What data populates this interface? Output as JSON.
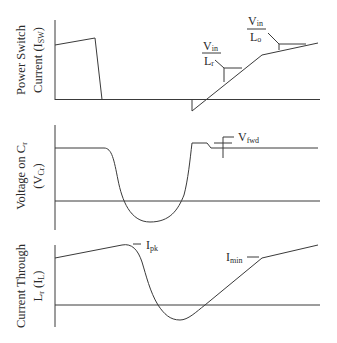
{
  "diagram": {
    "panels": [
      {
        "id": "power-switch-current",
        "ylabel_line1": "Power Switch",
        "ylabel_line2_main": "Current (I",
        "ylabel_line2_sub": "SW",
        "ylabel_line2_end": ")",
        "annotations": [
          {
            "num_main": "V",
            "num_sub": "in",
            "den_main": "L",
            "den_sub": "r"
          },
          {
            "num_main": "V",
            "num_sub": "in",
            "den_main": "L",
            "den_sub": "o"
          }
        ]
      },
      {
        "id": "voltage-on-cr",
        "ylabel_line1_main": "Voltage on C",
        "ylabel_line1_sub": "r",
        "ylabel_line2_main": "(V",
        "ylabel_line2_sub": "Cr",
        "ylabel_line2_end": ")",
        "annotations": [
          {
            "main": "V",
            "sub": "fwd"
          }
        ]
      },
      {
        "id": "current-through-lr",
        "ylabel_line1": "Current Through",
        "ylabel_line2_main": "L",
        "ylabel_line2_sub": "r",
        "ylabel_line2_mid": " (I",
        "ylabel_line2_sub2": "L",
        "ylabel_line2_end": ")",
        "annotations": [
          {
            "main": "I",
            "sub": "pk"
          },
          {
            "main": "I",
            "sub": "min"
          }
        ]
      }
    ]
  },
  "colors": {
    "line": "#3a3a3a",
    "text": "#2a2a2a",
    "background": "#ffffff"
  }
}
